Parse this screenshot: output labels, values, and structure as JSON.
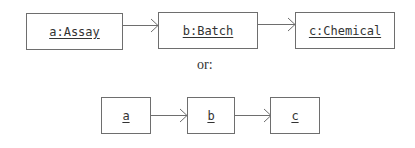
{
  "diagram": {
    "type": "uml-object-sequence",
    "separator_text": "or:",
    "row1": {
      "objects": [
        {
          "id": "a",
          "label": "a:Assay"
        },
        {
          "id": "b",
          "label": "b:Batch"
        },
        {
          "id": "c",
          "label": "c:Chemical"
        }
      ],
      "links": [
        {
          "from": "a",
          "to": "b"
        },
        {
          "from": "b",
          "to": "c"
        }
      ]
    },
    "row2": {
      "objects": [
        {
          "id": "a",
          "label": "a"
        },
        {
          "id": "b",
          "label": "b"
        },
        {
          "id": "c",
          "label": "c"
        }
      ],
      "links": [
        {
          "from": "a",
          "to": "b"
        },
        {
          "from": "b",
          "to": "c"
        }
      ]
    },
    "colors": {
      "stroke": "#6e6e6e",
      "text": "#333333",
      "background": "#ffffff"
    }
  }
}
